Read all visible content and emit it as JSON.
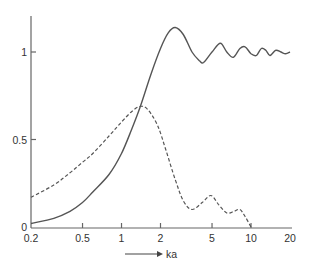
{
  "chart_data": {
    "type": "line",
    "title": "",
    "xlabel": "ka",
    "ylabel": "",
    "xscale": "log",
    "xlim": [
      0.2,
      20
    ],
    "ylim": [
      0,
      1.2
    ],
    "grid": false,
    "legend": null,
    "x_ticks": [
      {
        "value": 0.2,
        "label": "0.2"
      },
      {
        "value": 0.5,
        "label": "0.5"
      },
      {
        "value": 1,
        "label": "1"
      },
      {
        "value": 2,
        "label": "2"
      },
      {
        "value": 5,
        "label": "5"
      },
      {
        "value": 10,
        "label": "10"
      },
      {
        "value": 20,
        "label": "20"
      }
    ],
    "y_ticks": [
      {
        "value": 0,
        "label": "0"
      },
      {
        "value": 0.5,
        "label": "0.5"
      },
      {
        "value": 1,
        "label": "1"
      }
    ],
    "series": [
      {
        "name": "solid",
        "style": "solid",
        "points": [
          [
            0.2,
            0.02
          ],
          [
            0.3,
            0.05
          ],
          [
            0.4,
            0.09
          ],
          [
            0.5,
            0.14
          ],
          [
            0.6,
            0.2
          ],
          [
            0.8,
            0.3
          ],
          [
            1.0,
            0.42
          ],
          [
            1.2,
            0.56
          ],
          [
            1.4,
            0.69
          ],
          [
            1.7,
            0.88
          ],
          [
            2.0,
            1.02
          ],
          [
            2.3,
            1.11
          ],
          [
            2.6,
            1.14
          ],
          [
            3.0,
            1.1
          ],
          [
            3.5,
            1.0
          ],
          [
            4.0,
            0.95
          ],
          [
            4.3,
            0.94
          ],
          [
            5.0,
            1.0
          ],
          [
            5.8,
            1.05
          ],
          [
            6.5,
            1.0
          ],
          [
            7.3,
            0.97
          ],
          [
            8.2,
            1.02
          ],
          [
            9.0,
            1.03
          ],
          [
            10.0,
            0.99
          ],
          [
            11.0,
            0.98
          ],
          [
            12.0,
            1.02
          ],
          [
            13.0,
            1.01
          ],
          [
            14.0,
            0.98
          ],
          [
            15.5,
            1.01
          ],
          [
            17.0,
            1.0
          ],
          [
            18.5,
            0.99
          ],
          [
            20.0,
            1.0
          ]
        ]
      },
      {
        "name": "dashed",
        "style": "dashed",
        "points": [
          [
            0.2,
            0.17
          ],
          [
            0.3,
            0.24
          ],
          [
            0.4,
            0.31
          ],
          [
            0.5,
            0.37
          ],
          [
            0.6,
            0.42
          ],
          [
            0.8,
            0.52
          ],
          [
            1.0,
            0.6
          ],
          [
            1.2,
            0.66
          ],
          [
            1.4,
            0.69
          ],
          [
            1.6,
            0.67
          ],
          [
            1.9,
            0.58
          ],
          [
            2.2,
            0.44
          ],
          [
            2.6,
            0.27
          ],
          [
            3.0,
            0.15
          ],
          [
            3.5,
            0.1
          ],
          [
            4.2,
            0.14
          ],
          [
            4.9,
            0.18
          ],
          [
            5.6,
            0.13
          ],
          [
            6.5,
            0.08
          ],
          [
            7.4,
            0.09
          ],
          [
            8.2,
            0.1
          ],
          [
            9.0,
            0.06
          ],
          [
            10.0,
            0.0
          ]
        ]
      }
    ],
    "annotations": [
      {
        "type": "arrow",
        "text": "ka",
        "position": "below x-axis, pointing right"
      }
    ]
  },
  "labels": {
    "x_axis_arrow_label": "ka",
    "x_ticks": [
      "0.2",
      "0.5",
      "1",
      "2",
      "5",
      "10",
      "20"
    ],
    "y_ticks": [
      "0",
      "0.5",
      "1"
    ]
  }
}
